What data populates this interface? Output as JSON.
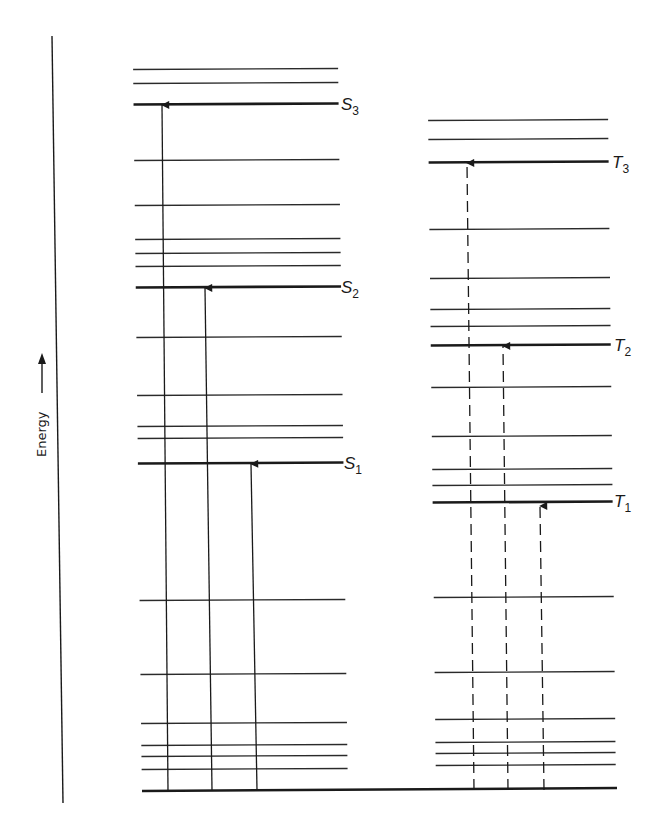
{
  "diagram": {
    "type": "energy-level-diagram",
    "axis": {
      "label": "Energy",
      "direction": "up"
    },
    "singlet_column": {
      "levels": [
        {
          "y": 69,
          "main": false
        },
        {
          "y": 83,
          "main": false
        },
        {
          "y": 104,
          "main": true,
          "label": "S",
          "sub": "3"
        },
        {
          "y": 160,
          "main": false
        },
        {
          "y": 205,
          "main": false
        },
        {
          "y": 239,
          "main": false
        },
        {
          "y": 253,
          "main": false
        },
        {
          "y": 266,
          "main": false
        },
        {
          "y": 287,
          "main": true,
          "label": "S",
          "sub": "2"
        },
        {
          "y": 337,
          "main": false
        },
        {
          "y": 395,
          "main": false
        },
        {
          "y": 426,
          "main": false
        },
        {
          "y": 438,
          "main": false
        },
        {
          "y": 463,
          "main": true,
          "label": "S",
          "sub": "1"
        },
        {
          "y": 600,
          "main": false
        },
        {
          "y": 674,
          "main": false
        },
        {
          "y": 723,
          "main": false
        },
        {
          "y": 745,
          "main": false
        },
        {
          "y": 756,
          "main": false
        },
        {
          "y": 769,
          "main": false
        }
      ],
      "transitions": [
        {
          "to": "S3",
          "style": "solid",
          "x0": 168,
          "x1": 162,
          "y_top": 104
        },
        {
          "to": "S2",
          "style": "solid",
          "x0": 212,
          "x1": 205,
          "y_top": 287
        },
        {
          "to": "S1",
          "style": "solid",
          "x0": 257,
          "x1": 251,
          "y_top": 463
        }
      ]
    },
    "triplet_column": {
      "levels": [
        {
          "y": 120,
          "main": false
        },
        {
          "y": 139,
          "main": false
        },
        {
          "y": 162,
          "main": true,
          "label": "T",
          "sub": "3"
        },
        {
          "y": 229,
          "main": false
        },
        {
          "y": 278,
          "main": false
        },
        {
          "y": 309,
          "main": false
        },
        {
          "y": 326,
          "main": false
        },
        {
          "y": 345,
          "main": true,
          "label": "T",
          "sub": "2"
        },
        {
          "y": 387,
          "main": false
        },
        {
          "y": 436,
          "main": false
        },
        {
          "y": 469,
          "main": false
        },
        {
          "y": 485,
          "main": false
        },
        {
          "y": 502,
          "main": true,
          "label": "T",
          "sub": "1"
        },
        {
          "y": 597,
          "main": false
        },
        {
          "y": 672,
          "main": false
        },
        {
          "y": 719,
          "main": false
        },
        {
          "y": 742,
          "main": false
        },
        {
          "y": 753,
          "main": false
        },
        {
          "y": 765,
          "main": false
        }
      ],
      "transitions": [
        {
          "to": "T3",
          "style": "dashed",
          "x0": 474,
          "x1": 467,
          "y_top": 162
        },
        {
          "to": "T2",
          "style": "dashed",
          "x0": 508,
          "x1": 503,
          "y_top": 345
        },
        {
          "to": "T1",
          "style": "dashed",
          "x0": 544,
          "x1": 540,
          "y_top": 505
        }
      ]
    },
    "ground_state": {
      "y": 790,
      "x_start": 142,
      "x_end": 617
    }
  },
  "labels": {
    "s3": "S",
    "s3_sub": "3",
    "s2": "S",
    "s2_sub": "2",
    "s1": "S",
    "s1_sub": "1",
    "t3": "T",
    "t3_sub": "3",
    "t2": "T",
    "t2_sub": "2",
    "t1": "T",
    "t1_sub": "1",
    "energy": "Energy"
  }
}
